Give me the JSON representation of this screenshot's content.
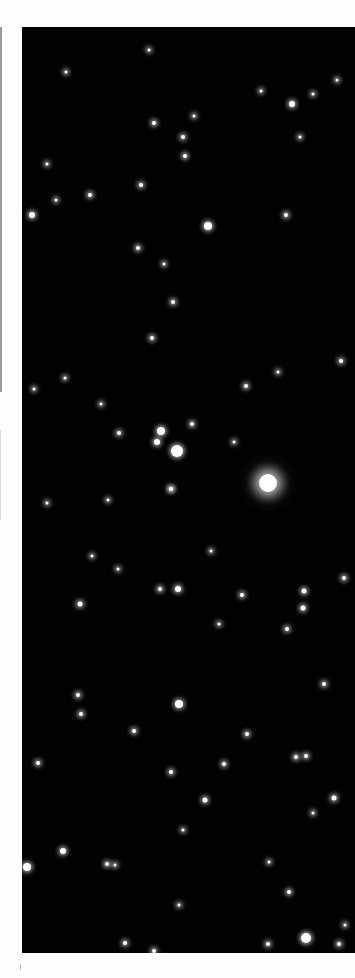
{
  "image": {
    "subject": "star field photograph",
    "background_color": "#020202",
    "margin_color": "#fdfdfd",
    "star_color": "#ffffff",
    "field": {
      "left": 22,
      "top": 27,
      "width": 333,
      "height": 926
    }
  },
  "stars": [
    {
      "x": 268,
      "y": 483,
      "r": 9,
      "type": "big"
    },
    {
      "x": 177,
      "y": 451,
      "r": 6,
      "type": "glow"
    },
    {
      "x": 161,
      "y": 431,
      "r": 4,
      "type": "glow"
    },
    {
      "x": 157,
      "y": 442,
      "r": 3,
      "type": "glow"
    },
    {
      "x": 208,
      "y": 226,
      "r": 4,
      "type": "glow"
    },
    {
      "x": 292,
      "y": 104,
      "r": 3,
      "type": "glow"
    },
    {
      "x": 32,
      "y": 215,
      "r": 3,
      "type": "glow"
    },
    {
      "x": 179,
      "y": 704,
      "r": 4,
      "type": "glow"
    },
    {
      "x": 306,
      "y": 938,
      "r": 5,
      "type": "glow"
    },
    {
      "x": 27,
      "y": 867,
      "r": 4,
      "type": "glow"
    },
    {
      "x": 63,
      "y": 851,
      "r": 3,
      "type": "glow"
    },
    {
      "x": 178,
      "y": 589,
      "r": 3,
      "type": "glow"
    },
    {
      "x": 80,
      "y": 604,
      "r": 2.5,
      "type": "glow"
    },
    {
      "x": 171,
      "y": 489,
      "r": 2,
      "type": "glow"
    },
    {
      "x": 154,
      "y": 123,
      "r": 2,
      "type": "glow"
    },
    {
      "x": 185,
      "y": 156,
      "r": 2,
      "type": "glow"
    },
    {
      "x": 183,
      "y": 137,
      "r": 2,
      "type": "glow"
    },
    {
      "x": 141,
      "y": 185,
      "r": 2,
      "type": "glow"
    },
    {
      "x": 90,
      "y": 195,
      "r": 2,
      "type": "glow"
    },
    {
      "x": 138,
      "y": 248,
      "r": 2,
      "type": "glow"
    },
    {
      "x": 173,
      "y": 302,
      "r": 2,
      "type": "glow"
    },
    {
      "x": 152,
      "y": 338,
      "r": 2,
      "type": "glow"
    },
    {
      "x": 286,
      "y": 215,
      "r": 2,
      "type": "glow"
    },
    {
      "x": 341,
      "y": 361,
      "r": 2,
      "type": "glow"
    },
    {
      "x": 246,
      "y": 386,
      "r": 2,
      "type": "glow"
    },
    {
      "x": 119,
      "y": 433,
      "r": 2,
      "type": "glow"
    },
    {
      "x": 192,
      "y": 424,
      "r": 2,
      "type": "glow"
    },
    {
      "x": 234,
      "y": 442,
      "r": 1.5,
      "type": "glow"
    },
    {
      "x": 65,
      "y": 378,
      "r": 1.5,
      "type": "glow"
    },
    {
      "x": 34,
      "y": 389,
      "r": 1.5,
      "type": "glow"
    },
    {
      "x": 101,
      "y": 404,
      "r": 1.5,
      "type": "glow"
    },
    {
      "x": 171,
      "y": 489,
      "r": 1.5,
      "type": "glow"
    },
    {
      "x": 47,
      "y": 503,
      "r": 1.5,
      "type": "glow"
    },
    {
      "x": 242,
      "y": 595,
      "r": 2,
      "type": "glow"
    },
    {
      "x": 304,
      "y": 591,
      "r": 2.5,
      "type": "glow"
    },
    {
      "x": 303,
      "y": 608,
      "r": 2.5,
      "type": "glow"
    },
    {
      "x": 287,
      "y": 629,
      "r": 2,
      "type": "glow"
    },
    {
      "x": 160,
      "y": 589,
      "r": 2,
      "type": "glow"
    },
    {
      "x": 92,
      "y": 556,
      "r": 1.5,
      "type": "glow"
    },
    {
      "x": 118,
      "y": 569,
      "r": 1.5,
      "type": "glow"
    },
    {
      "x": 344,
      "y": 578,
      "r": 2,
      "type": "glow"
    },
    {
      "x": 324,
      "y": 684,
      "r": 2,
      "type": "glow"
    },
    {
      "x": 78,
      "y": 695,
      "r": 2,
      "type": "glow"
    },
    {
      "x": 81,
      "y": 714,
      "r": 2,
      "type": "glow"
    },
    {
      "x": 38,
      "y": 763,
      "r": 2,
      "type": "glow"
    },
    {
      "x": 134,
      "y": 731,
      "r": 2,
      "type": "glow"
    },
    {
      "x": 171,
      "y": 772,
      "r": 2,
      "type": "glow"
    },
    {
      "x": 224,
      "y": 764,
      "r": 2,
      "type": "glow"
    },
    {
      "x": 205,
      "y": 800,
      "r": 2.5,
      "type": "glow"
    },
    {
      "x": 296,
      "y": 757,
      "r": 2,
      "type": "glow"
    },
    {
      "x": 334,
      "y": 798,
      "r": 2.5,
      "type": "glow"
    },
    {
      "x": 247,
      "y": 734,
      "r": 2,
      "type": "glow"
    },
    {
      "x": 306,
      "y": 756,
      "r": 2,
      "type": "glow"
    },
    {
      "x": 183,
      "y": 830,
      "r": 1.5,
      "type": "glow"
    },
    {
      "x": 107,
      "y": 864,
      "r": 2,
      "type": "glow"
    },
    {
      "x": 115,
      "y": 865,
      "r": 1.5,
      "type": "glow"
    },
    {
      "x": 268,
      "y": 944,
      "r": 2,
      "type": "glow"
    },
    {
      "x": 125,
      "y": 943,
      "r": 2,
      "type": "glow"
    },
    {
      "x": 154,
      "y": 951,
      "r": 2,
      "type": "glow"
    },
    {
      "x": 289,
      "y": 892,
      "r": 2,
      "type": "glow"
    },
    {
      "x": 179,
      "y": 905,
      "r": 1.5,
      "type": "glow"
    },
    {
      "x": 339,
      "y": 944,
      "r": 2,
      "type": "glow"
    },
    {
      "x": 345,
      "y": 925,
      "r": 1.5,
      "type": "glow"
    },
    {
      "x": 149,
      "y": 50,
      "r": 1.5,
      "type": "glow"
    },
    {
      "x": 66,
      "y": 72,
      "r": 1.5,
      "type": "glow"
    },
    {
      "x": 261,
      "y": 91,
      "r": 1.5,
      "type": "glow"
    },
    {
      "x": 194,
      "y": 116,
      "r": 1.5,
      "type": "glow"
    },
    {
      "x": 337,
      "y": 80,
      "r": 1.5,
      "type": "glow"
    },
    {
      "x": 300,
      "y": 137,
      "r": 1.5,
      "type": "glow"
    },
    {
      "x": 313,
      "y": 94,
      "r": 1.5,
      "type": "glow"
    },
    {
      "x": 47,
      "y": 164,
      "r": 1.5,
      "type": "glow"
    },
    {
      "x": 164,
      "y": 264,
      "r": 1.5,
      "type": "glow"
    },
    {
      "x": 56,
      "y": 200,
      "r": 1.5,
      "type": "glow"
    },
    {
      "x": 278,
      "y": 372,
      "r": 1.5,
      "type": "glow"
    },
    {
      "x": 108,
      "y": 500,
      "r": 1.5,
      "type": "glow"
    },
    {
      "x": 211,
      "y": 551,
      "r": 1.5,
      "type": "glow"
    },
    {
      "x": 219,
      "y": 624,
      "r": 1.5,
      "type": "glow"
    },
    {
      "x": 313,
      "y": 813,
      "r": 1.5,
      "type": "glow"
    },
    {
      "x": 269,
      "y": 862,
      "r": 1.5,
      "type": "glow"
    }
  ],
  "margins": {
    "left_strip_color": "#9a9a9a"
  }
}
